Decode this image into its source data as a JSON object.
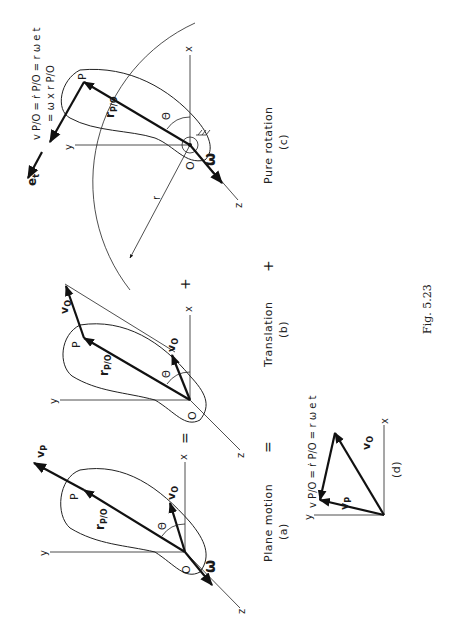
{
  "figure": {
    "number": "Fig. 5.23",
    "orientation": "rotated 90° counter-clockwise",
    "colors": {
      "ink": "#1a1a1a",
      "background": "#ffffff"
    }
  },
  "operators": {
    "equals_1": "=",
    "equals_2": "=",
    "plus_1": "+",
    "plus_2": "+"
  },
  "panels": {
    "a": {
      "title": "Plane motion",
      "tag": "(a)",
      "point_O": "O",
      "point_P": "P",
      "axis_x": "x",
      "axis_y": "y",
      "axis_z": "z",
      "vector_r": "r",
      "vector_r_sub": "P/O",
      "vector_vO": "v",
      "vector_vO_sub": "O",
      "vector_vP": "v",
      "vector_vP_sub": "P",
      "angle": "Θ",
      "omega": "ω"
    },
    "b": {
      "title": "Translation",
      "tag": "(b)",
      "point_O": "O",
      "point_P": "P",
      "axis_x": "x",
      "axis_y": "y",
      "axis_z": "z",
      "vector_r": "r",
      "vector_r_sub": "P/O",
      "vector_vO_at_O": "v",
      "vector_vO_at_O_sub": "O",
      "vector_vO_at_P": "v",
      "vector_vO_at_P_sub": "O",
      "angle": "Θ"
    },
    "c": {
      "title": "Pure rotation",
      "tag": "(c)",
      "point_O": "O",
      "point_P": "P",
      "axis_x": "x",
      "axis_y": "y",
      "axis_z": "z",
      "vector_r": "r",
      "vector_r_sub": "P/O",
      "radius": "r",
      "angle": "Θ",
      "omega": "ω",
      "unit_vector": "e",
      "unit_vector_sub": "t",
      "equation_line1": "v P/O = ṙ P/O = r ω e t",
      "equation_line2": "= ω x r P/O"
    },
    "d": {
      "tag": "(d)",
      "axis_x": "x",
      "axis_y": "y",
      "vector_vO": "v",
      "vector_vO_sub": "O",
      "vector_vP": "v",
      "vector_vP_sub": "P",
      "equation": "v P/O = ṙ P/O = r ω e t"
    }
  }
}
